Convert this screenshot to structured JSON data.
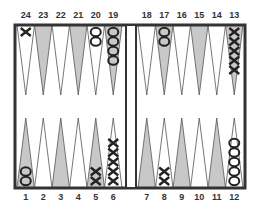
{
  "board": {
    "title": "Backgammon board position",
    "colors": {
      "frame": "#333333",
      "light_point": "#ffffff",
      "dark_point": "#c8c8c8",
      "checker_stroke": "#222222"
    },
    "top_labels": [
      "24",
      "23",
      "22",
      "21",
      "20",
      "19",
      "18",
      "17",
      "16",
      "15",
      "14",
      "13"
    ],
    "bottom_labels": [
      "1",
      "2",
      "3",
      "4",
      "5",
      "6",
      "7",
      "8",
      "9",
      "10",
      "11",
      "12"
    ],
    "checkers": [
      {
        "point": 24,
        "player": "X",
        "count": 1
      },
      {
        "point": 20,
        "player": "O",
        "count": 2
      },
      {
        "point": 19,
        "player": "O",
        "count": 4
      },
      {
        "point": 17,
        "player": "O",
        "count": 2
      },
      {
        "point": 13,
        "player": "X",
        "count": 5
      },
      {
        "point": 1,
        "player": "O",
        "count": 2
      },
      {
        "point": 5,
        "player": "X",
        "count": 2
      },
      {
        "point": 6,
        "player": "X",
        "count": 5
      },
      {
        "point": 8,
        "player": "X",
        "count": 2
      },
      {
        "point": 12,
        "player": "O",
        "count": 5
      }
    ]
  }
}
